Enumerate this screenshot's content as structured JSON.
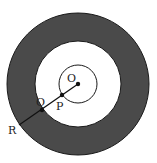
{
  "diagram": {
    "type": "concentric-circles",
    "colors": {
      "ring_fill": "#4a4a4a",
      "stroke": "#1a1a1a",
      "background": "#ffffff"
    },
    "center": [
      78,
      84
    ],
    "outer_radius": 71,
    "middle_radius": 43,
    "inner_radius": 19,
    "labels": {
      "O": "O",
      "P": "P",
      "Q": "Q",
      "R": "R"
    },
    "points": {
      "O": [
        78,
        84
      ],
      "P": [
        62,
        95
      ],
      "Q": [
        42,
        110
      ],
      "R": [
        19,
        125
      ]
    }
  }
}
